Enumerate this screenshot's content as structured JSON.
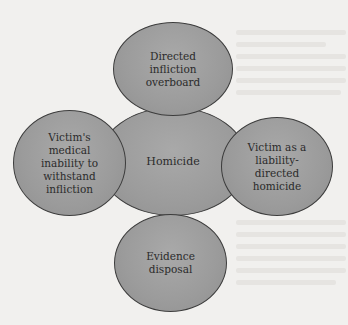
{
  "diagram": {
    "center": {
      "label": "Homicide"
    },
    "nodes": {
      "top": {
        "label": "Directed\ninfliction\noverboard"
      },
      "left": {
        "label": "Victim's\nmedical\ninability to\nwithstand\ninfliction"
      },
      "right": {
        "label": "Victim as a\nliability-\ndirected\nhomicide"
      },
      "bottom": {
        "label": "Evidence\ndisposal"
      }
    }
  },
  "colors": {
    "background": "#f1f0ee",
    "node_fill": "#9b9b9b",
    "node_border": "#3c3c3c",
    "text": "#2b2b2b"
  }
}
